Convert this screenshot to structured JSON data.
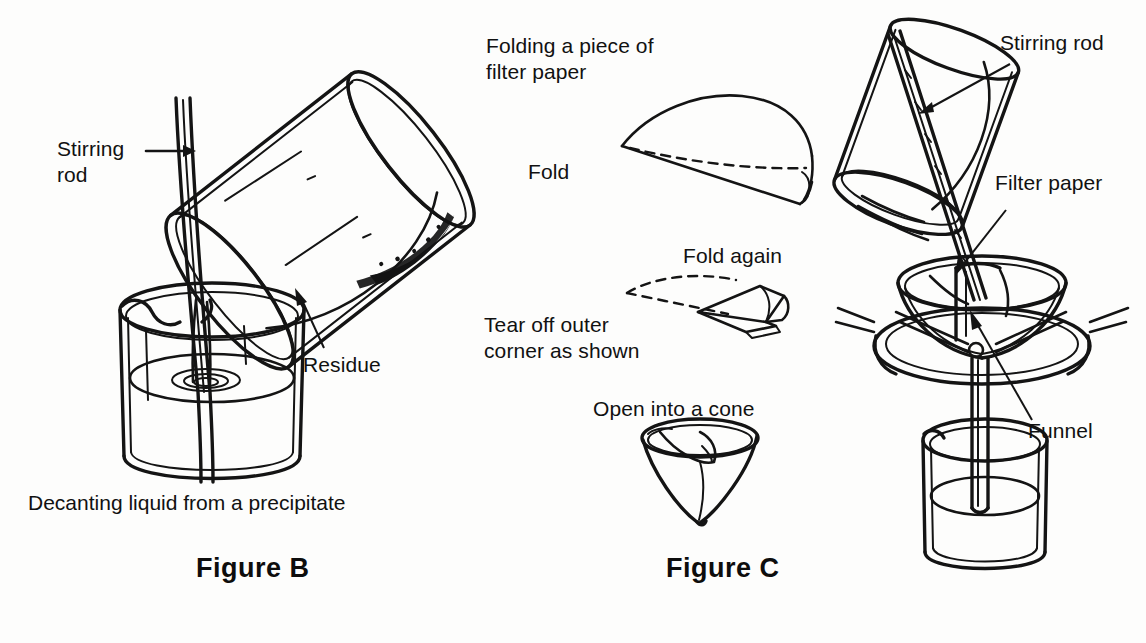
{
  "page": {
    "background_color": "#fdfdfc",
    "ink_color": "#141414"
  },
  "figure_b": {
    "id": "figure-b",
    "label": "Figure B",
    "caption": "Decanting liquid from a precipitate",
    "annotations": [
      {
        "name": "stirring-rod",
        "text": "Stirring\nrod",
        "pointer": "arrow-right"
      },
      {
        "name": "residue",
        "text": "Residue",
        "pointer": "arrow-up-left"
      }
    ],
    "objects": [
      "tilted-beaker-pouring",
      "upright-receiving-beaker",
      "stirring-rod",
      "liquid-stream",
      "dark-residue-deposit"
    ]
  },
  "figure_c": {
    "id": "figure-c",
    "label": "Figure C",
    "sequence_title": "Folding a piece of\nfilter paper",
    "steps": [
      {
        "name": "step-fold",
        "label": "Fold",
        "shape": "folded-semicircle"
      },
      {
        "name": "step-fold-again",
        "label": "Fold again",
        "shape": "quarter-wedge"
      },
      {
        "name": "step-tear-corner",
        "label": "Tear off outer\ncorner as shown",
        "shape": "quarter-wedge"
      },
      {
        "name": "step-open-cone",
        "label": "Open into a cone",
        "shape": "paper-cone"
      }
    ],
    "annotations": [
      {
        "name": "stirring-rod",
        "text": "Stirring rod",
        "pointer": "arrow-down-left"
      },
      {
        "name": "filter-paper",
        "text": "Filter paper",
        "pointer": "arrow-down-left"
      },
      {
        "name": "funnel",
        "text": "Funnel",
        "pointer": "arrow-up-left"
      }
    ],
    "objects": [
      "tilted-beaker-pouring",
      "stirring-rod",
      "filter-paper-cone",
      "funnel",
      "support-ring",
      "receiving-beaker"
    ]
  }
}
